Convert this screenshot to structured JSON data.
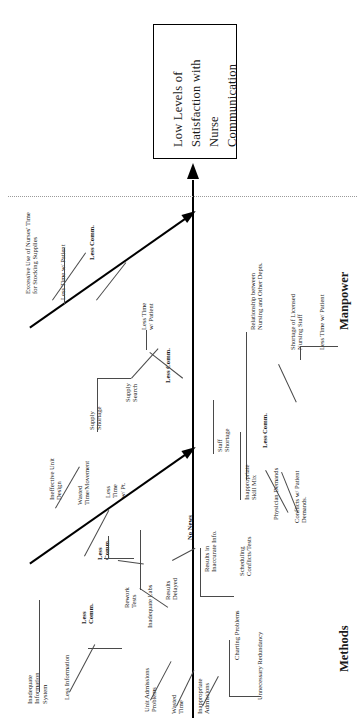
{
  "diagram": {
    "type": "fishbone-ishikawa",
    "orientation": "rotated-90-ccw",
    "effect": "Low Levels of Satisfaction with Nurse Communication",
    "effect_lines": [
      "Low Levels of",
      "Satisfaction with",
      "Nurse",
      "Communication"
    ],
    "categories": [
      {
        "name": "Manpower",
        "label": "Manpower"
      },
      {
        "name": "Methods",
        "label": "Methods"
      }
    ]
  },
  "labels": {
    "excessive_supplies": "Excessive Use of Nurses' Time\nfor Stocking Supplies",
    "less_time_patient_1": "Less Time w/ Patient",
    "less_comm_1": "Less Comm.",
    "supply_shortage": "Supply\nShortage",
    "supply_search": "Supply\nSearch",
    "less_time_patient_2": "Less Time\nw/ Patient",
    "less_comm_2": "Less Comm.",
    "relationship_depts": "Relationship between\nNursing and Other Depts.",
    "shortage_licensed": "Shortage of Licensed\nNursing Staff",
    "less_time_patient_3": "Less Time w/ Patient",
    "staff_shortage": "Staff\nShortage",
    "inappropriate_skill_mix": "Inappropriate\nSkill Mix",
    "physician_demands": "Physician Demands",
    "conflicts_patient_demands": "Conflicts w/ Patient\nDemands.",
    "less_comm_3": "Less Comm.",
    "ineffective_unit_design": "Ineffective Unit\nDesign",
    "wasted_time_movement": "Wasted\nTime/Movement",
    "less_time_pt": "Less\nTime\nw/ Pt.",
    "less_comm_4": "Less\nComm.",
    "inadequate_info_system": "Inadequate\nInformation\nSystem",
    "less_information": "Less Information",
    "less_comm_5": "Less\nComm.",
    "rework_tests": "Rework\nTests",
    "inadequate_labs": "Inadequate Labs",
    "results_delayed": "Results\nDelayed",
    "no_news": "No News",
    "results_inaccurate": "Results in\nInaccurate Info.",
    "scheduling_conflicts": "Scheduling\nConflicts/Tests",
    "unit_admissions_problems": "Unit Admissions\nProblems",
    "wasted_time": "Wasted\nTime",
    "inappropriate_admissions": "Inappropriate\nAdmissions",
    "charting_problems": "Charting Problems",
    "unnecessary_redundancy": "Unnecessary Redundancy"
  },
  "colors": {
    "ink": "#1a1a1a",
    "bone": "#000000",
    "twig": "#4a4a4a",
    "background": "#ffffff",
    "separator": "#9a9a9a"
  }
}
